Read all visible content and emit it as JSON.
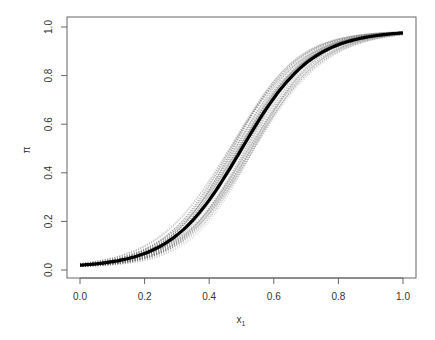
{
  "chart_data": {
    "type": "line",
    "title": "",
    "xlabel": "x",
    "xlabel_subscript": "1",
    "ylabel": "π",
    "xlim": [
      0,
      1
    ],
    "ylim": [
      0,
      1
    ],
    "xticks": [
      0.0,
      0.2,
      0.4,
      0.6,
      0.8,
      1.0
    ],
    "xtick_labels": [
      "0.0",
      "0.2",
      "0.4",
      "0.6",
      "0.8",
      "1.0"
    ],
    "yticks": [
      0.0,
      0.2,
      0.4,
      0.6,
      0.8,
      1.0
    ],
    "ytick_labels": [
      "0.0",
      "0.2",
      "0.4",
      "0.6",
      "0.8",
      "1.0"
    ],
    "grid": false,
    "legend": null,
    "series": [
      {
        "name": "central logistic curve",
        "style": "bold black",
        "x": [
          0.0,
          0.1,
          0.2,
          0.3,
          0.4,
          0.5,
          0.6,
          0.7,
          0.8,
          0.9,
          1.0
        ],
        "values": [
          0.01,
          0.03,
          0.08,
          0.19,
          0.38,
          0.5,
          0.67,
          0.84,
          0.93,
          0.97,
          0.985
        ]
      },
      {
        "name": "posterior draws (band)",
        "style": "thin gray dotted, many overlapping",
        "count_approx": 100,
        "slope_range": [
          8.5,
          10.5
        ],
        "midpoint_range": [
          0.46,
          0.54
        ]
      }
    ],
    "colors": {
      "central": "#000000",
      "draws": "#555555",
      "axis": "#555555"
    }
  }
}
